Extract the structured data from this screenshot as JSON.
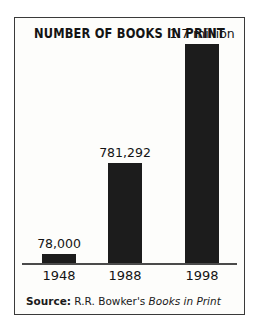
{
  "figure": {
    "title": "NUMBER OF BOOKS IN PRINT",
    "source_label": "Source:",
    "source_publisher": "R.R. Bowker's",
    "source_work": "Books in Print"
  },
  "colors": {
    "bar": "#1c1c1c",
    "border": "#3a3a3a",
    "axis": "#4a4a4a",
    "background": "#fdfdfb",
    "text": "#141414"
  },
  "chart_data": {
    "type": "bar",
    "title": "NUMBER OF BOOKS IN PRINT",
    "xlabel": "",
    "ylabel": "",
    "grid": false,
    "legend": "none",
    "ylim": [
      0,
      1700000
    ],
    "categories": [
      "1948",
      "1988",
      "1998"
    ],
    "values": [
      78000,
      781292,
      1700000
    ],
    "value_labels": [
      "78,000",
      "781,292",
      "1.7 million"
    ],
    "bars": [
      {
        "category": "1948",
        "value": 78000,
        "label": "78,000"
      },
      {
        "category": "1988",
        "value": 781292,
        "label": "781,292"
      },
      {
        "category": "1998",
        "value": 1700000,
        "label": "1.7 million"
      }
    ]
  }
}
